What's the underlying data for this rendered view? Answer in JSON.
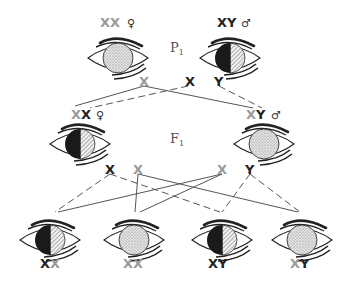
{
  "diagram": {
    "type": "sex-linked inheritance (eye color)",
    "colors": {
      "black": "#222222",
      "grey": "#9a9a9a",
      "line": "#555555"
    },
    "generations": {
      "p1": {
        "label": "P",
        "subscript": "1"
      },
      "f1": {
        "label": "F",
        "subscript": "1"
      }
    },
    "p1": {
      "female": {
        "chrom1": "X",
        "chrom2": "X",
        "chrom1_color": "grey",
        "chrom2_color": "grey",
        "sex_symbol": "♀",
        "eye": "stippled"
      },
      "male": {
        "chrom1": "X",
        "chrom2": "Y",
        "chrom1_color": "black",
        "chrom2_color": "black",
        "sex_symbol": "♂",
        "eye": "half-black-half-hatched"
      },
      "gametes": [
        {
          "label": "X",
          "color": "grey"
        },
        {
          "label": "X",
          "color": "black"
        },
        {
          "label": "Y",
          "color": "black"
        }
      ]
    },
    "f1": {
      "female": {
        "chrom1": "X",
        "chrom2": "X",
        "chrom1_color": "grey",
        "chrom2_color": "black",
        "sex_symbol": "♀",
        "eye": "half-black-half-hatched"
      },
      "male": {
        "chrom1": "X",
        "chrom2": "Y",
        "chrom1_color": "grey",
        "chrom2_color": "black",
        "sex_symbol": "♂",
        "eye": "stippled"
      },
      "gametes": [
        {
          "label": "X",
          "color": "black"
        },
        {
          "label": "X",
          "color": "grey"
        },
        {
          "label": "X",
          "color": "grey"
        },
        {
          "label": "Y",
          "color": "black"
        }
      ]
    },
    "f2": [
      {
        "chrom1": "X",
        "chrom2": "X",
        "chrom1_color": "black",
        "chrom2_color": "grey",
        "eye": "half-black-half-hatched"
      },
      {
        "chrom1": "X",
        "chrom2": "X",
        "chrom1_color": "grey",
        "chrom2_color": "grey",
        "eye": "stippled"
      },
      {
        "chrom1": "X",
        "chrom2": "Y",
        "chrom1_color": "black",
        "chrom2_color": "black",
        "eye": "half-black-half-hatched"
      },
      {
        "chrom1": "X",
        "chrom2": "Y",
        "chrom1_color": "grey",
        "chrom2_color": "black",
        "eye": "stippled"
      }
    ]
  }
}
